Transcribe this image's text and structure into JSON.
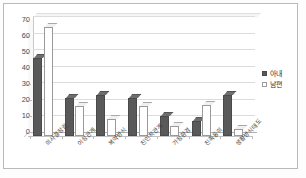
{
  "chart_data": {
    "type": "bar",
    "title": "",
    "subtitle": "",
    "xlabel": "",
    "ylabel": "",
    "ylim": [
      0,
      70
    ],
    "yticks": [
      0,
      10,
      20,
      30,
      40,
      50,
      60,
      70
    ],
    "grid": true,
    "legend_position": "right",
    "style": "clustered-column-3d",
    "categories": [
      "의사결정권",
      "이성관계",
      "복약방식",
      "친인척관계",
      "가정환경",
      "친족동의",
      "생활방식태도"
    ],
    "series": [
      {
        "name": "아내",
        "color": "#595959",
        "values": [
          47,
          23,
          25,
          23,
          12,
          9,
          25
        ]
      },
      {
        "name": "남편",
        "color": "#ffffff",
        "values": [
          66,
          18,
          10,
          18,
          6,
          19,
          4
        ]
      }
    ]
  },
  "legend": {
    "items": [
      {
        "label": "아내"
      },
      {
        "label": "남편"
      }
    ]
  }
}
